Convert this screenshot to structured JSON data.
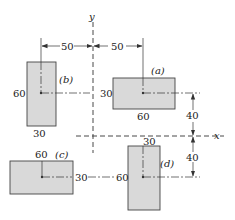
{
  "axes": {
    "x_label": "x",
    "y_label": "y"
  },
  "dimensions": {
    "horizontal_left": "50",
    "horizontal_right": "50",
    "vertical_upper": "40",
    "vertical_lower": "40"
  },
  "shapes": [
    {
      "id": "a",
      "label": "(a)",
      "width_label": "60",
      "height_label": "30"
    },
    {
      "id": "b",
      "label": "(b)",
      "width_label": "30",
      "height_label": "60"
    },
    {
      "id": "c",
      "label": "(c)",
      "width_label": "60",
      "height_label": "30"
    },
    {
      "id": "d",
      "label": "(d)",
      "width_label": "30",
      "height_label": "60"
    }
  ]
}
